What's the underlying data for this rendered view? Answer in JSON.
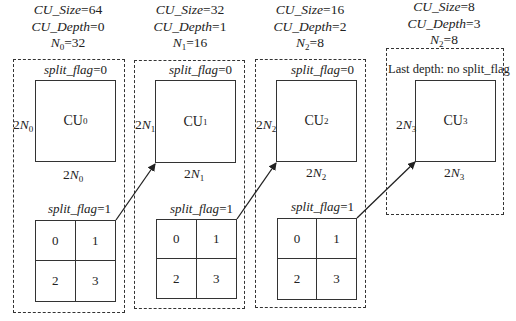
{
  "levels": [
    {
      "cu_size_label": "CU_Size",
      "cu_size": "64",
      "cu_depth_label": "CU_Depth",
      "cu_depth": "0",
      "n_symbol": "N",
      "n_sub": "0",
      "n_value": "32",
      "flag0": "split_flag",
      "flag0_val": "=0",
      "cu_name": "CU",
      "cu_sub": "0",
      "dim_prefix": "2",
      "dim_sym": "N",
      "dim_sub": "0",
      "flag1": "split_flag",
      "flag1_val": "=1",
      "quadrants": [
        "0",
        "1",
        "2",
        "3"
      ]
    },
    {
      "cu_size_label": "CU_Size",
      "cu_size": "32",
      "cu_depth_label": "CU_Depth",
      "cu_depth": "1",
      "n_symbol": "N",
      "n_sub": "1",
      "n_value": "16",
      "flag0": "split_flag",
      "flag0_val": "=0",
      "cu_name": "CU",
      "cu_sub": "1",
      "dim_prefix": "2",
      "dim_sym": "N",
      "dim_sub": "1",
      "flag1": "split_flag",
      "flag1_val": "=1",
      "quadrants": [
        "0",
        "1",
        "2",
        "3"
      ]
    },
    {
      "cu_size_label": "CU_Size",
      "cu_size": "16",
      "cu_depth_label": "CU_Depth",
      "cu_depth": "2",
      "n_symbol": "N",
      "n_sub": "2",
      "n_value": "8",
      "flag0": "split_flag",
      "flag0_val": "=0",
      "cu_name": "CU",
      "cu_sub": "2",
      "dim_prefix": "2",
      "dim_sym": "N",
      "dim_sub": "2",
      "flag1": "split_flag",
      "flag1_val": "=1",
      "quadrants": [
        "0",
        "1",
        "2",
        "3"
      ]
    },
    {
      "cu_size_label": "CU_Size",
      "cu_size": "8",
      "cu_depth_label": "CU_Depth",
      "cu_depth": "3",
      "n_symbol": "N",
      "n_sub": "2",
      "n_value": "8",
      "note": "Last depth: no split_flag",
      "cu_name": "CU",
      "cu_sub": "3",
      "dim_prefix": "2",
      "dim_sym": "N",
      "dim_sub": "3"
    }
  ],
  "arrows": [
    {
      "from": "level0-split-grid",
      "to": "level1-cu"
    },
    {
      "from": "level1-split-grid",
      "to": "level2-cu"
    },
    {
      "from": "level2-split-grid",
      "to": "level3-cu"
    }
  ]
}
